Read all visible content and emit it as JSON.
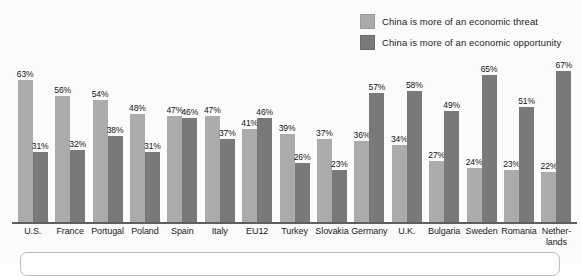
{
  "legend": {
    "items": [
      {
        "label": "China is more of an economic threat",
        "color": "#ababab",
        "key": "threat"
      },
      {
        "label": "China is more of an economic opportunity",
        "color": "#797979",
        "key": "opportunity"
      }
    ]
  },
  "chart_data": {
    "type": "bar",
    "title": "",
    "subtitle": "",
    "xlabel": "",
    "ylabel": "",
    "ylim": [
      0,
      70
    ],
    "grid": false,
    "legend_position": "top-right",
    "value_suffix": "%",
    "categories": [
      "U.S.",
      "France",
      "Portugal",
      "Poland",
      "Spain",
      "Italy",
      "EU12",
      "Turkey",
      "Slovakia",
      "Germany",
      "U.K.",
      "Bulgaria",
      "Sweden",
      "Romania",
      "Nether-lands"
    ],
    "series": [
      {
        "name": "China is more of an economic threat",
        "color": "#ababab",
        "values": [
          63,
          56,
          54,
          48,
          47,
          47,
          41,
          39,
          37,
          36,
          34,
          27,
          24,
          23,
          22
        ],
        "labels": [
          "63%",
          "56%",
          "54%",
          "48%",
          "47%",
          "47%",
          "41%",
          "39%",
          "37%",
          "36%",
          "34%",
          "27%",
          "24%",
          "23%",
          "22%"
        ]
      },
      {
        "name": "China is more of an economic opportunity",
        "color": "#797979",
        "values": [
          31,
          32,
          38,
          31,
          46,
          37,
          46,
          26,
          23,
          57,
          58,
          49,
          65,
          51,
          67
        ],
        "labels": [
          "31%",
          "32%",
          "38%",
          "31%",
          "46%",
          "37%",
          "46%",
          "26%",
          "23%",
          "57%",
          "58%",
          "49%",
          "65%",
          "51%",
          "67%"
        ]
      }
    ]
  },
  "axis": {
    "labels": [
      {
        "line1": "U.S.",
        "line2": ""
      },
      {
        "line1": "France",
        "line2": ""
      },
      {
        "line1": "Portugal",
        "line2": ""
      },
      {
        "line1": "Poland",
        "line2": ""
      },
      {
        "line1": "Spain",
        "line2": ""
      },
      {
        "line1": "Italy",
        "line2": ""
      },
      {
        "line1": "EU12",
        "line2": ""
      },
      {
        "line1": "Turkey",
        "line2": ""
      },
      {
        "line1": "Slovakia",
        "line2": ""
      },
      {
        "line1": "Germany",
        "line2": ""
      },
      {
        "line1": "U.K.",
        "line2": ""
      },
      {
        "line1": "Bulgaria",
        "line2": ""
      },
      {
        "line1": "Sweden",
        "line2": ""
      },
      {
        "line1": "Romania",
        "line2": ""
      },
      {
        "line1": "Nether-",
        "line2": "lands"
      }
    ]
  }
}
